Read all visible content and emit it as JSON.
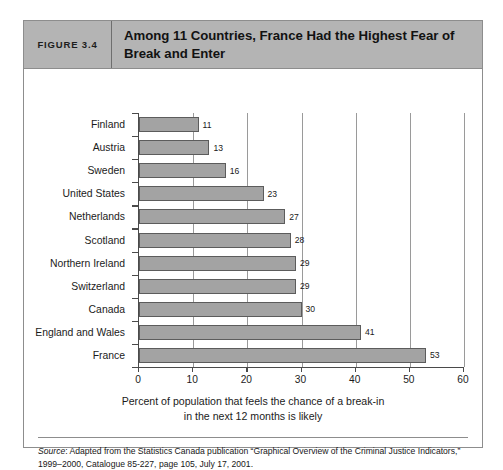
{
  "figure": {
    "number_label": "FIGURE 3.4",
    "title": "Among 11 Countries, France Had the Highest Fear of Break and Enter"
  },
  "source": {
    "prefix": "Source",
    "text": ": Adapted from the Statistics Canada publication “Graphical Overview of the Criminal Justice Indicators,” 1999–2000, Catalogue 85-227, page 105, July 17, 2001."
  },
  "colors": {
    "header_band": "#b4b4b4",
    "bar_fill": "#a3a3a3",
    "bar_border": "#5c5c5c",
    "axis": "#4a4a4a",
    "gridline": "#9a9a9a",
    "frame": "#8d8d8d"
  },
  "chart_data": {
    "type": "bar",
    "orientation": "horizontal",
    "title": "Among 11 Countries, France Had the Highest Fear of Break and Enter",
    "xlabel": "Percent of population that feels the chance of a break-in in the next 12 months is likely",
    "xlabel_line1": "Percent of population that feels the chance of a break-in",
    "xlabel_line2": "in the next 12 months is likely",
    "ylabel": "",
    "categories": [
      "Finland",
      "Austria",
      "Sweden",
      "United States",
      "Netherlands",
      "Scotland",
      "Northern Ireland",
      "Switzerland",
      "Canada",
      "England and Wales",
      "France"
    ],
    "values": [
      11,
      13,
      16,
      23,
      27,
      28,
      29,
      29,
      30,
      41,
      53
    ],
    "value_labels": [
      "11",
      "13",
      "16",
      "23",
      "27",
      "28",
      "29",
      "29",
      "30",
      "41",
      "53"
    ],
    "xlim": [
      0,
      60
    ],
    "xticks": [
      0,
      10,
      20,
      30,
      40,
      50,
      60
    ],
    "xtick_labels": [
      "0",
      "10",
      "20",
      "30",
      "40",
      "50",
      "60"
    ],
    "grid": true,
    "grid_axis": "x",
    "legend": false
  }
}
